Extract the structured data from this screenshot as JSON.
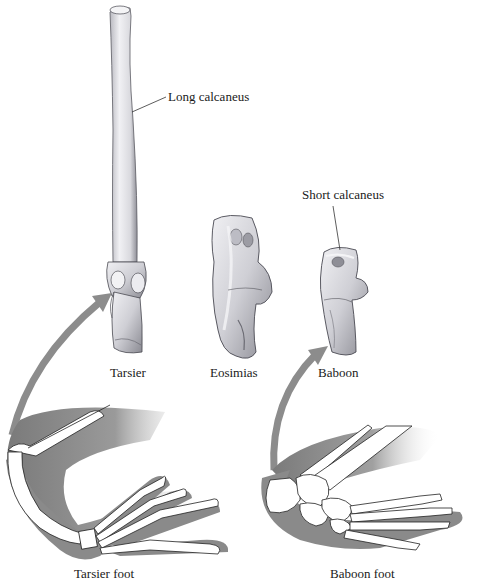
{
  "figure": {
    "type": "anatomical-comparison",
    "labels": {
      "long_calcaneus": "Long calcaneus",
      "short_calcaneus": "Short calcaneus",
      "tarsier": "Tarsier",
      "eosimias": "Eosimias",
      "baboon": "Baboon",
      "tarsier_foot": "Tarsier foot",
      "baboon_foot": "Baboon foot"
    },
    "colors": {
      "background": "#ffffff",
      "bone_fill": "#e6e6ea",
      "bone_shade": "#9a9aa2",
      "bone_outline": "#4a4a52",
      "arrow": "#8c8c8c",
      "shadow": "#8a8a8a",
      "skeleton_fill": "#ffffff",
      "text": "#1a1a1a"
    }
  }
}
